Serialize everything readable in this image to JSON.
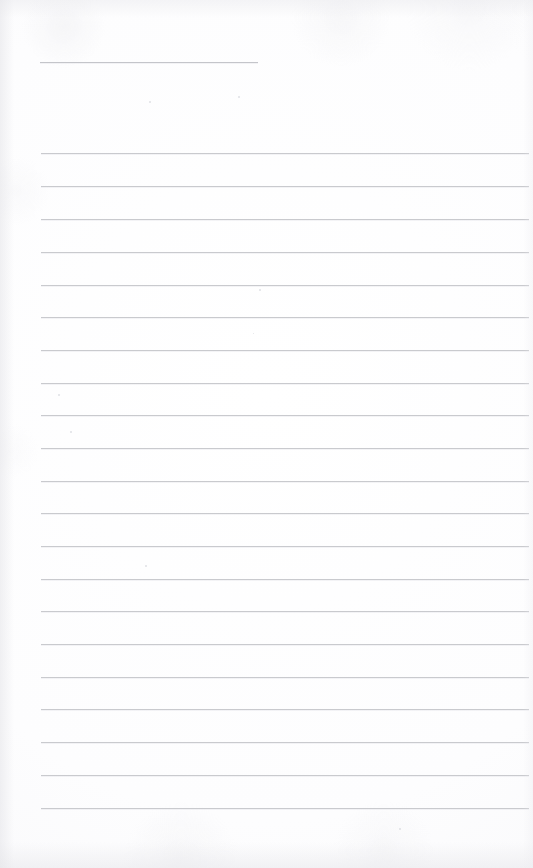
{
  "document": {
    "type": "scanned-notebook-page",
    "title_field_label": "",
    "body_text": "",
    "page_width": 533,
    "page_height": 868,
    "is_blank": true,
    "colors": {
      "paper": "#fdfdfd",
      "rule_line": "#c9cace",
      "header_rule_line": "#c4c5ca",
      "edge_shadow": "#e4e4e8"
    }
  },
  "header_rule": {
    "name": "title-rule",
    "x": 40,
    "y": 62,
    "width": 218,
    "label": ""
  },
  "rules": {
    "count": 21,
    "left": 41,
    "right": 529,
    "first_y": 153,
    "spacing": 32.75,
    "lines": [
      {
        "index": 1,
        "y": 153,
        "content": ""
      },
      {
        "index": 2,
        "y": 186,
        "content": ""
      },
      {
        "index": 3,
        "y": 219,
        "content": ""
      },
      {
        "index": 4,
        "y": 252,
        "content": ""
      },
      {
        "index": 5,
        "y": 285,
        "content": ""
      },
      {
        "index": 6,
        "y": 317,
        "content": ""
      },
      {
        "index": 7,
        "y": 350,
        "content": ""
      },
      {
        "index": 8,
        "y": 383,
        "content": ""
      },
      {
        "index": 9,
        "y": 415,
        "content": ""
      },
      {
        "index": 10,
        "y": 448,
        "content": ""
      },
      {
        "index": 11,
        "y": 481,
        "content": ""
      },
      {
        "index": 12,
        "y": 513,
        "content": ""
      },
      {
        "index": 13,
        "y": 546,
        "content": ""
      },
      {
        "index": 14,
        "y": 579,
        "content": ""
      },
      {
        "index": 15,
        "y": 611,
        "content": ""
      },
      {
        "index": 16,
        "y": 644,
        "content": ""
      },
      {
        "index": 17,
        "y": 677,
        "content": ""
      },
      {
        "index": 18,
        "y": 709,
        "content": ""
      },
      {
        "index": 19,
        "y": 742,
        "content": ""
      },
      {
        "index": 20,
        "y": 775,
        "content": ""
      },
      {
        "index": 21,
        "y": 808,
        "content": ""
      }
    ]
  },
  "specks": [
    {
      "x": 149,
      "y": 101,
      "size": 2
    },
    {
      "x": 238,
      "y": 96,
      "size": 2
    },
    {
      "x": 58,
      "y": 394,
      "size": 2
    },
    {
      "x": 259,
      "y": 289,
      "size": 2
    },
    {
      "x": 70,
      "y": 431,
      "size": 2
    },
    {
      "x": 145,
      "y": 565,
      "size": 2
    },
    {
      "x": 399,
      "y": 828,
      "size": 2
    },
    {
      "x": 253,
      "y": 333,
      "size": 1
    }
  ]
}
